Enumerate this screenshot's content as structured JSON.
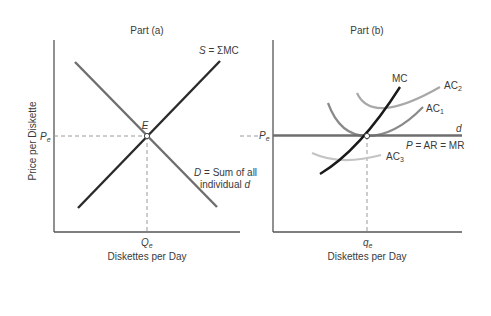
{
  "part_a": {
    "title": "Part (a)",
    "y_axis_label": "Price per Diskette",
    "x_axis_label": "Diskettes per Day",
    "price_tick": {
      "main": "P",
      "sub": "e"
    },
    "quantity_tick": {
      "main": "Q",
      "sub": "e"
    },
    "equilibrium_label": "E",
    "supply_label": {
      "var": "S",
      "rest": " = ΣMC"
    },
    "demand_label": {
      "line1_var": "D",
      "line1_rest": " = Sum of all",
      "line2_text": "individual ",
      "line2_var": "d"
    }
  },
  "part_b": {
    "title": "Part (b)",
    "x_axis_label": "Diskettes per Day",
    "price_tick": {
      "main": "P",
      "sub": "e"
    },
    "quantity_tick": {
      "main": "q",
      "sub": "e"
    },
    "mc_label": "MC",
    "ac2_label": {
      "main": "AC",
      "sub": "2"
    },
    "ac1_label": {
      "main": "AC",
      "sub": "1"
    },
    "ac3_label": {
      "main": "AC",
      "sub": "3"
    },
    "d_label": "d",
    "price_line_label": {
      "var": "P",
      "rest": " = AR = MR"
    }
  },
  "colors": {
    "axis": "#555555",
    "supply": "#2a2a2a",
    "demand": "#6e6e6e",
    "mc": "#1a1a1a",
    "d_line": "#6e6e6e",
    "ac1": "#8a8a8a",
    "ac2": "#a8a8a8",
    "ac3": "#c4c4c4",
    "dashed": "#9a9a9a"
  }
}
